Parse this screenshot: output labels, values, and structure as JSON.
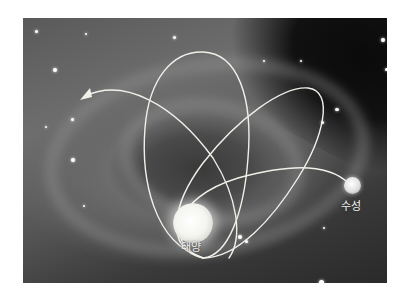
{
  "figure": {
    "background": "spiral-galaxy-photo",
    "path_color": "#f0efe8",
    "labels": {
      "sun": "태양",
      "mercury": "수성"
    },
    "objects": [
      {
        "name": "sun",
        "label": "태양",
        "color": "#f4f4f0"
      },
      {
        "name": "mercury",
        "label": "수성",
        "color": "#e0e0e0"
      }
    ],
    "path": {
      "loops": 3,
      "direction_arrow": "left-pointing arrowhead at upper-left end of path"
    }
  }
}
